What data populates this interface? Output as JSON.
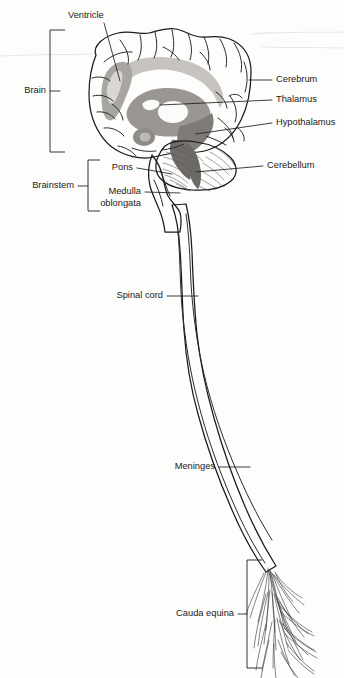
{
  "figure": {
    "background_color": "#fdfdfc",
    "ink_color": "#1b1b1b",
    "shade_light": "#cfcdcb",
    "shade_mid": "#a9a6a3",
    "shade_dark": "#8b8885",
    "shade_darkest": "#6e6b68"
  },
  "labels": {
    "ventricle": "Ventricle",
    "brain": "Brain",
    "cerebrum": "Cerebrum",
    "thalamus": "Thalamus",
    "hypothalamus": "Hypothalamus",
    "cerebellum": "Cerebellum",
    "brainstem": "Brainstem",
    "pons": "Pons",
    "medulla_line1": "Medulla",
    "medulla_line2": "oblongata",
    "spinal_cord": "Spinal cord",
    "meninges": "Meninges",
    "cauda_equina": "Cauda equina"
  },
  "brackets": {
    "brain": {
      "label": "Brain",
      "top": 30,
      "bottom": 152,
      "x": 50
    },
    "brainstem": {
      "label": "Brainstem",
      "top": 160,
      "bottom": 211,
      "x": 88
    },
    "cauda_equina": {
      "label": "Cauda equina",
      "top": 560,
      "bottom": 668,
      "x": 247
    }
  },
  "structures": [
    {
      "name": "cerebrum",
      "label": "Cerebrum"
    },
    {
      "name": "ventricle",
      "label": "Ventricle"
    },
    {
      "name": "thalamus",
      "label": "Thalamus"
    },
    {
      "name": "hypothalamus",
      "label": "Hypothalamus"
    },
    {
      "name": "cerebellum",
      "label": "Cerebellum"
    },
    {
      "name": "pons",
      "label": "Pons"
    },
    {
      "name": "medulla-oblongata",
      "label": "Medulla oblongata"
    },
    {
      "name": "spinal-cord",
      "label": "Spinal cord"
    },
    {
      "name": "meninges",
      "label": "Meninges"
    },
    {
      "name": "cauda-equina",
      "label": "Cauda equina"
    }
  ]
}
